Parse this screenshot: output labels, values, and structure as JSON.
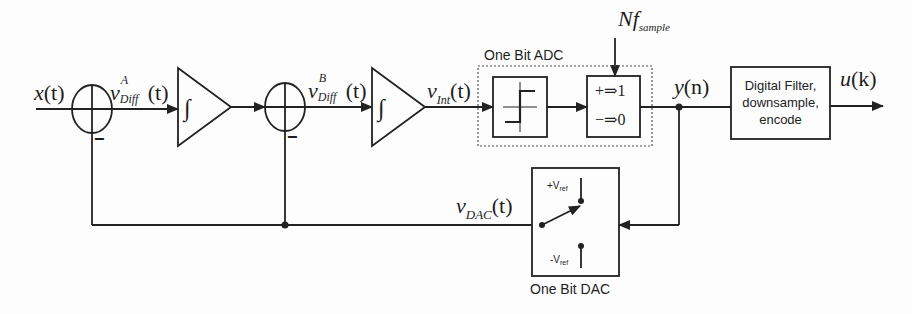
{
  "diagram": {
    "colors": {
      "line": "#222222",
      "background": "#fdfdfd",
      "dashed": "#555555"
    },
    "signals": {
      "input": {
        "base": "x",
        "arg": "(t)"
      },
      "diff_a": {
        "base": "v",
        "sub": "Diff",
        "sup": "A",
        "arg": "(t)"
      },
      "diff_b": {
        "base": "v",
        "sub": "Diff",
        "sup": "B",
        "arg": "(t)"
      },
      "int": {
        "base": "v",
        "sub": "Int",
        "arg": "(t)"
      },
      "y": {
        "base": "y",
        "arg": "(n)"
      },
      "u": {
        "base": "u",
        "arg": "(k)"
      },
      "dac": {
        "base": "v",
        "sub": "DAC",
        "arg": "(t)"
      },
      "clock": {
        "base": "Nf",
        "sub": "sample"
      }
    },
    "summers": [
      {
        "id": "sum-1",
        "sign_bottom": "−"
      },
      {
        "id": "sum-2",
        "sign_bottom": "−"
      }
    ],
    "integrators": [
      {
        "id": "integrator-1",
        "symbol": "∫"
      },
      {
        "id": "integrator-2",
        "symbol": "∫"
      }
    ],
    "adc": {
      "label": "One Bit ADC",
      "quantizer": {
        "line1": "+⇒1",
        "line2": "−⇒0"
      }
    },
    "digital_filter": {
      "lines": [
        "Digital Filter,",
        "downsample,",
        "encode"
      ]
    },
    "dac": {
      "label": "One Bit DAC",
      "plus_ref": {
        "prefix": "+V",
        "sub": "ref"
      },
      "minus_ref": {
        "prefix": "-V",
        "sub": "ref"
      }
    }
  }
}
